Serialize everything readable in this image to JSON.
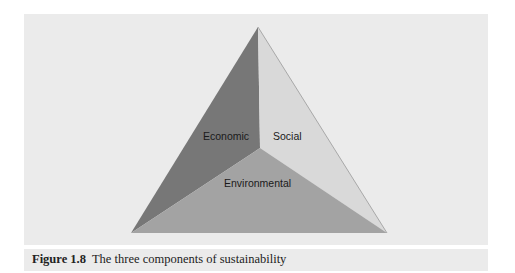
{
  "figure": {
    "number_label": "Figure 1.8",
    "caption": "The three components of sustainability",
    "segments": [
      {
        "label": "Economic",
        "color": "#7a7a7a"
      },
      {
        "label": "Social",
        "color": "#d8d8d8"
      },
      {
        "label": "Environmental",
        "color": "#a4a4a4"
      }
    ]
  }
}
